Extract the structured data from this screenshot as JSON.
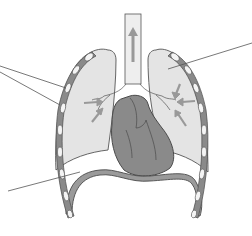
{
  "diagram": {
    "type": "anatomical-illustration",
    "structures": [
      {
        "id": "trachea",
        "label": ""
      },
      {
        "id": "left-lung",
        "label": ""
      },
      {
        "id": "right-lung",
        "label": ""
      },
      {
        "id": "heart",
        "label": ""
      },
      {
        "id": "diaphragm",
        "label": ""
      },
      {
        "id": "ribs-left",
        "label": ""
      },
      {
        "id": "ribs-right",
        "label": ""
      },
      {
        "id": "bronchi",
        "label": ""
      }
    ],
    "leader_lines": [
      {
        "id": "pointer-ribs-upper",
        "target": "ribs",
        "from": [
          0,
          66
        ],
        "to": [
          66,
          88
        ]
      },
      {
        "id": "pointer-ribs-lower",
        "target": "ribs",
        "from": [
          0,
          72
        ],
        "to": [
          60,
          105
        ]
      },
      {
        "id": "pointer-lung",
        "target": "lung",
        "from": [
          252,
          43
        ],
        "to": [
          168,
          69
        ]
      },
      {
        "id": "pointer-diaphragm",
        "target": "diaphragm",
        "from": [
          8,
          191
        ],
        "to": [
          80,
          172
        ]
      }
    ],
    "arrows": {
      "trachea": "up",
      "lungs": "inward"
    },
    "colors": {
      "background": "#ffffff",
      "lung_fill": "#e4e4e4",
      "lung_stroke": "#555555",
      "heart_fill": "#8a8a8a",
      "heart_stroke": "#4a4a4a",
      "diaphragm_fill": "#9a9a9a",
      "rib_dark": "#7a7a7a",
      "rib_light": "#f4f4f4",
      "arrow": "#9a9a9a",
      "leader": "#555555"
    }
  }
}
